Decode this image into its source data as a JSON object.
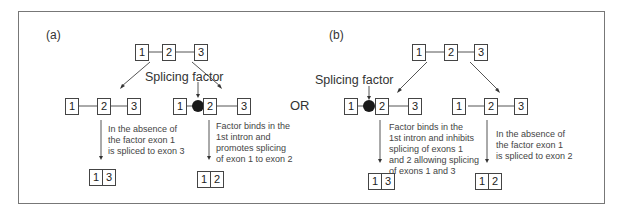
{
  "panels": [
    {
      "label": "(a)",
      "top_gene": [
        "1",
        "2",
        "3"
      ],
      "factor_label": "Splicing factor",
      "left_branch": {
        "exons": [
          "1",
          "2",
          "3"
        ],
        "note": "In the absence of\nthe factor exon 1\nis spliced to exon 3",
        "product": [
          "1",
          "3"
        ]
      },
      "right_branch": {
        "exons": [
          "1",
          "2",
          "3"
        ],
        "factor_bound": true,
        "note": "Factor binds in the\n1st intron and\npromotes splicing\nof exon 1 to exon 2",
        "product": [
          "1",
          "2"
        ]
      }
    },
    {
      "label": "(b)",
      "top_gene": [
        "1",
        "2",
        "3"
      ],
      "factor_label": "Splicing factor",
      "left_branch": {
        "exons": [
          "1",
          "2",
          "3"
        ],
        "factor_bound": true,
        "note": "Factor binds in the\n1st intron and inhibits\nsplicing of exons 1\nand 2 allowing splicing\nof exons 1 and 3",
        "product": [
          "1",
          "3"
        ]
      },
      "right_branch": {
        "exons": [
          "1",
          "2",
          "3"
        ],
        "note": "In the absence of\nthe factor exon 1\nis spliced to exon 2",
        "product": [
          "1",
          "2"
        ]
      }
    }
  ],
  "separator": "OR",
  "colors": {
    "line": "#555555",
    "factor": "#1a1a1a",
    "frame": "#777777"
  }
}
